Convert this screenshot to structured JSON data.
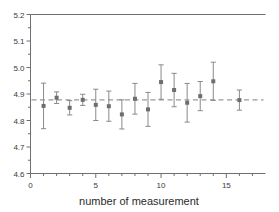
{
  "chart_data": {
    "type": "scatter",
    "title": "",
    "subtitle": "",
    "xlabel": "number of measurement",
    "ylabel": "",
    "xlim": [
      0,
      18
    ],
    "ylim": [
      4.6,
      5.2
    ],
    "x_ticks_major": [
      0,
      5,
      10,
      15
    ],
    "x_ticks_minor": [
      1,
      2,
      3,
      4,
      6,
      7,
      8,
      9,
      11,
      12,
      13,
      14,
      16,
      17
    ],
    "y_ticks_major": [
      4.6,
      4.7,
      4.8,
      4.9,
      5.0,
      5.1,
      5.2
    ],
    "y_tick_labels": [
      "4.6",
      "4.7",
      "4.8",
      "4.9",
      "5.0",
      "5.1",
      "5.2"
    ],
    "x_tick_labels": [
      "0",
      "5",
      "10",
      "15"
    ],
    "y_ticks_minor": [
      4.65,
      4.75,
      4.85,
      4.95,
      5.05,
      5.15
    ],
    "grid": false,
    "legend": false,
    "marker": "square",
    "marker_color": "#6e6e6e",
    "errorbar_color": "#8a8a8a",
    "reference_line": {
      "value": 4.878,
      "style": "dashed",
      "color": "#9a9a9a",
      "label": ""
    },
    "x": [
      1,
      2,
      3,
      4,
      5,
      6,
      7,
      8,
      9,
      10,
      11,
      12,
      13,
      14,
      16
    ],
    "values": [
      4.855,
      4.886,
      4.848,
      4.878,
      4.859,
      4.854,
      4.823,
      4.882,
      4.842,
      4.945,
      4.915,
      4.867,
      4.892,
      4.948,
      4.877
    ],
    "errors": [
      0.086,
      0.022,
      0.027,
      0.021,
      0.059,
      0.057,
      0.055,
      0.058,
      0.064,
      0.065,
      0.063,
      0.073,
      0.055,
      0.072,
      0.038
    ],
    "series": [
      {
        "name": "measurements",
        "points": [
          {
            "x": 1,
            "y": 4.855,
            "err": 0.086
          },
          {
            "x": 2,
            "y": 4.886,
            "err": 0.022
          },
          {
            "x": 3,
            "y": 4.848,
            "err": 0.027
          },
          {
            "x": 4,
            "y": 4.878,
            "err": 0.021
          },
          {
            "x": 5,
            "y": 4.859,
            "err": 0.059
          },
          {
            "x": 6,
            "y": 4.854,
            "err": 0.057
          },
          {
            "x": 7,
            "y": 4.823,
            "err": 0.055
          },
          {
            "x": 8,
            "y": 4.882,
            "err": 0.058
          },
          {
            "x": 9,
            "y": 4.842,
            "err": 0.064
          },
          {
            "x": 10,
            "y": 4.945,
            "err": 0.065
          },
          {
            "x": 11,
            "y": 4.915,
            "err": 0.063
          },
          {
            "x": 12,
            "y": 4.867,
            "err": 0.073
          },
          {
            "x": 13,
            "y": 4.892,
            "err": 0.055
          },
          {
            "x": 14,
            "y": 4.948,
            "err": 0.072
          },
          {
            "x": 16,
            "y": 4.877,
            "err": 0.038
          }
        ]
      }
    ]
  },
  "axes": {
    "left_spine": true,
    "top_spine": true,
    "bottom_spine": true,
    "right_spine": false
  }
}
